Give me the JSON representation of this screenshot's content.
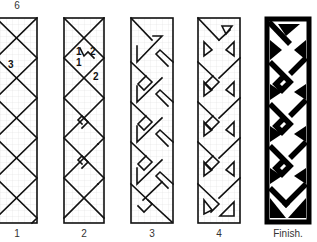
{
  "title_number": "6",
  "panels": [
    {
      "id": "1",
      "label": "1",
      "annotations": [
        "3"
      ]
    },
    {
      "id": "2",
      "label": "2",
      "annotations": [
        "1",
        "2",
        "1",
        "2"
      ]
    },
    {
      "id": "3",
      "label": "3"
    },
    {
      "id": "4",
      "label": "4"
    },
    {
      "id": "finish",
      "label": "Finish."
    }
  ],
  "colors": {
    "line": "#111111",
    "grid": "#d8d8d8",
    "background": "#ffffff"
  }
}
